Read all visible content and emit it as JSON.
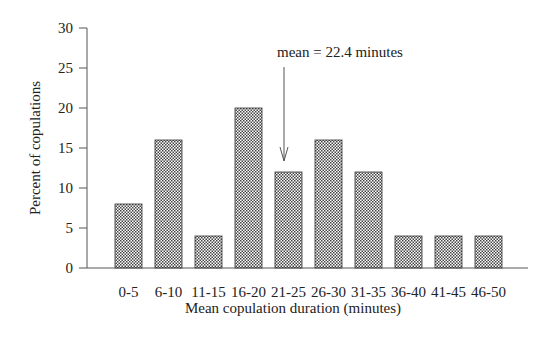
{
  "chart_data": {
    "type": "bar",
    "title": "",
    "xlabel": "Mean copulation duration (minutes)",
    "ylabel": "Percent of copulations",
    "categories": [
      "0-5",
      "6-10",
      "11-15",
      "16-20",
      "21-25",
      "26-30",
      "31-35",
      "36-40",
      "41-45",
      "46-50"
    ],
    "values": [
      8,
      16,
      4,
      20,
      12,
      16,
      12,
      4,
      4,
      4
    ],
    "ylim": [
      0,
      30
    ],
    "yticks": [
      0,
      5,
      10,
      15,
      20,
      25,
      30
    ],
    "grid": false,
    "legend": null,
    "bar_fill": "crosshatch",
    "annotations": [
      {
        "text": "mean = 22.4 minutes",
        "x_value": 22.4,
        "type": "arrow"
      }
    ]
  },
  "colors": {
    "axis": "#555555",
    "bar_edge": "#333333",
    "hatch": "#444444",
    "background": "#ffffff"
  }
}
